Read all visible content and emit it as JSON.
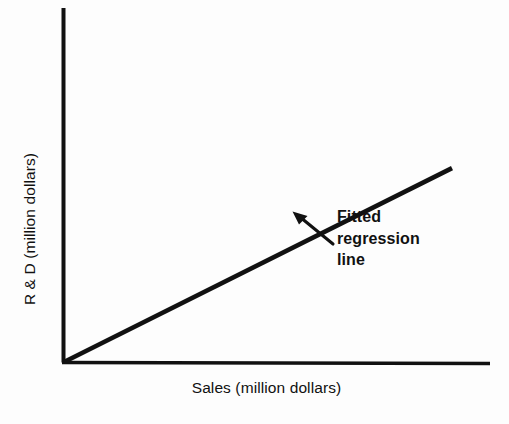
{
  "figure": {
    "background_color": "#fdfdfd",
    "ink_color": "#111111"
  },
  "axes": {
    "x_title": "Sales (million dollars)",
    "y_title": "R & D (million dollars)",
    "x_tick_labels": [],
    "y_tick_labels": [],
    "grid": "off"
  },
  "annotation": {
    "line1": "Fitted",
    "line2": "regression",
    "line3": "line",
    "full_text": "Fitted regression line",
    "pointer": "arrow-pointing-up-left-to-line"
  },
  "chart_data": {
    "type": "line",
    "title": "",
    "subtitle": "",
    "xlabel": "Sales (million dollars)",
    "ylabel": "R & D (million dollars)",
    "xlim": [
      0,
      100
    ],
    "ylim": [
      0,
      100
    ],
    "grid": false,
    "legend": "none",
    "x_tick_labels": [],
    "y_tick_labels": [],
    "series": [
      {
        "name": "Fitted regression line",
        "type": "line",
        "x": [
          0,
          100
        ],
        "values": [
          0,
          74
        ],
        "intercept": 0,
        "slope": 0.74,
        "color": "#111111",
        "width": 4.6
      }
    ],
    "annotations": [
      {
        "text": "Fitted regression line",
        "target_x": 59,
        "target_y": 43,
        "label_x": 70,
        "label_y": 41,
        "arrow": true
      }
    ]
  }
}
